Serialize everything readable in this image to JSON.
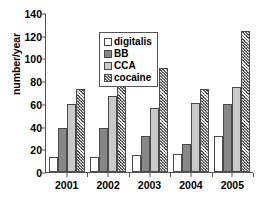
{
  "chart_data": {
    "type": "bar",
    "title": "",
    "xlabel": "",
    "ylabel": "number/year",
    "categories": [
      "2001",
      "2002",
      "2003",
      "2004",
      "2005"
    ],
    "series": [
      {
        "name": "digitalis",
        "values": [
          13,
          13,
          15,
          16,
          32
        ],
        "color": "#ffffff",
        "pattern": "solid"
      },
      {
        "name": "BB",
        "values": [
          39,
          39,
          32,
          25,
          60
        ],
        "color": "#878787",
        "pattern": "solid"
      },
      {
        "name": "CCA",
        "values": [
          60,
          67,
          56,
          61,
          75
        ],
        "color": "#c9c9c9",
        "pattern": "solid"
      },
      {
        "name": "cocaine",
        "values": [
          73,
          91,
          92,
          73,
          124
        ],
        "color": "#7d7d7d",
        "pattern": "cross-hatch"
      }
    ],
    "ylim": [
      0,
      140
    ],
    "yticks": [
      0,
      20,
      40,
      60,
      80,
      100,
      120,
      140
    ],
    "ytick_labels": [
      "0",
      "20",
      "40",
      "60",
      "80",
      "100",
      "120",
      "140"
    ],
    "grid": false,
    "legend_position": "top-left-inside",
    "legend_entries": [
      "digitalis",
      "BB",
      "CCA",
      "cocaine"
    ]
  }
}
